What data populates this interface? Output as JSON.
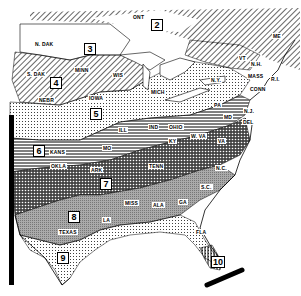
{
  "map": {
    "title": "Plant hardiness zone map — Eastern United States",
    "zones": [
      {
        "id": "2",
        "x": 151,
        "y": 19
      },
      {
        "id": "3",
        "x": 84,
        "y": 43
      },
      {
        "id": "4",
        "x": 50,
        "y": 77
      },
      {
        "id": "5",
        "x": 90,
        "y": 108
      },
      {
        "id": "6",
        "x": 33,
        "y": 145
      },
      {
        "id": "7",
        "x": 100,
        "y": 178
      },
      {
        "id": "8",
        "x": 68,
        "y": 211
      },
      {
        "id": "9",
        "x": 57,
        "y": 252
      },
      {
        "id": "10",
        "x": 211,
        "y": 256
      }
    ],
    "states": [
      {
        "label": "N. DAK",
        "x": 34,
        "y": 41
      },
      {
        "label": "S. DAK",
        "x": 26,
        "y": 71
      },
      {
        "label": "MINN",
        "x": 74,
        "y": 67
      },
      {
        "label": "WIS",
        "x": 112,
        "y": 72
      },
      {
        "label": "NEBR",
        "x": 38,
        "y": 97
      },
      {
        "label": "IOWA",
        "x": 88,
        "y": 95
      },
      {
        "label": "MICH",
        "x": 150,
        "y": 89
      },
      {
        "label": "ILL",
        "x": 118,
        "y": 127
      },
      {
        "label": "IND",
        "x": 148,
        "y": 124
      },
      {
        "label": "OHIO",
        "x": 168,
        "y": 124
      },
      {
        "label": "PA",
        "x": 213,
        "y": 102
      },
      {
        "label": "N.Y.",
        "x": 210,
        "y": 77
      },
      {
        "label": "VT",
        "x": 238,
        "y": 55
      },
      {
        "label": "N.H.",
        "x": 250,
        "y": 61
      },
      {
        "label": "ME",
        "x": 272,
        "y": 33
      },
      {
        "label": "MASS",
        "x": 247,
        "y": 73
      },
      {
        "label": "R.I.",
        "x": 270,
        "y": 76
      },
      {
        "label": "CONN",
        "x": 249,
        "y": 86
      },
      {
        "label": "N.J.",
        "x": 243,
        "y": 108
      },
      {
        "label": "DEL",
        "x": 242,
        "y": 119
      },
      {
        "label": "MD",
        "x": 223,
        "y": 114
      },
      {
        "label": "W. VA",
        "x": 190,
        "y": 133
      },
      {
        "label": "VA",
        "x": 217,
        "y": 138
      },
      {
        "label": "KY",
        "x": 168,
        "y": 138
      },
      {
        "label": "KANS",
        "x": 49,
        "y": 149
      },
      {
        "label": "MO",
        "x": 102,
        "y": 145
      },
      {
        "label": "OKLA",
        "x": 50,
        "y": 163
      },
      {
        "label": "ARK",
        "x": 90,
        "y": 167
      },
      {
        "label": "TENN",
        "x": 148,
        "y": 163
      },
      {
        "label": "N.C.",
        "x": 215,
        "y": 165
      },
      {
        "label": "S.C.",
        "x": 200,
        "y": 184
      },
      {
        "label": "TEXAS",
        "x": 58,
        "y": 229
      },
      {
        "label": "LA",
        "x": 102,
        "y": 217
      },
      {
        "label": "MISS",
        "x": 124,
        "y": 200
      },
      {
        "label": "ALA",
        "x": 152,
        "y": 202
      },
      {
        "label": "GA",
        "x": 178,
        "y": 199
      },
      {
        "label": "FLA",
        "x": 195,
        "y": 229
      },
      {
        "label": "ONT",
        "x": 132,
        "y": 14
      }
    ]
  }
}
